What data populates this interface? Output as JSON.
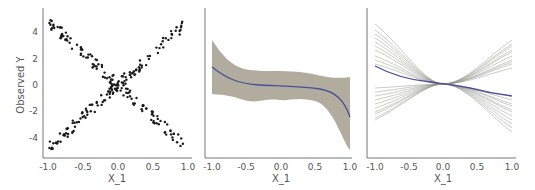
{
  "chart_data": [
    {
      "type": "scatter",
      "title": "",
      "xlabel": "X_1",
      "ylabel": "Observed Y",
      "xlim": [
        -1.0,
        1.0
      ],
      "ylim": [
        -5.2,
        5.2
      ],
      "xticks": [
        "-1.0",
        "-0.5",
        "0.0",
        "0.5",
        "1.0"
      ],
      "yticks": [
        "4",
        "2",
        "0",
        "-2",
        "-4"
      ],
      "grid": false,
      "series": [
        {
          "name": "y = 5x (increasing arm)",
          "x": [
            -1.0,
            -0.5,
            0.0,
            0.5,
            1.0
          ],
          "y": [
            -4.8,
            -2.5,
            0.0,
            2.5,
            4.8
          ]
        },
        {
          "name": "y = -5x (decreasing arm)",
          "x": [
            -1.0,
            -0.5,
            0.0,
            0.5,
            1.0
          ],
          "y": [
            4.9,
            2.5,
            0.0,
            -2.5,
            -4.8
          ]
        }
      ]
    },
    {
      "type": "line",
      "title": "",
      "xlabel": "X_1",
      "ylabel": "",
      "xlim": [
        -1.0,
        1.0
      ],
      "xticks": [
        "-1.0",
        "-0.5",
        "0.0",
        "0.5",
        "1.0"
      ],
      "grid": false,
      "series": [
        {
          "name": "mean",
          "x": [
            -1.0,
            -0.75,
            -0.5,
            -0.25,
            0.0,
            0.25,
            0.5,
            0.75,
            1.0
          ],
          "y": [
            1.4,
            0.6,
            0.2,
            0.05,
            0.0,
            0.0,
            -0.2,
            -0.8,
            -2.5
          ]
        },
        {
          "name": "upper band",
          "x": [
            -1.0,
            -0.75,
            -0.5,
            -0.25,
            0.0,
            0.25,
            0.5,
            0.75,
            1.0
          ],
          "y": [
            3.4,
            2.0,
            1.6,
            1.4,
            1.6,
            1.5,
            1.2,
            1.2,
            1.4
          ]
        },
        {
          "name": "lower band",
          "x": [
            -1.0,
            -0.75,
            -0.5,
            -0.25,
            0.0,
            0.25,
            0.5,
            0.75,
            1.0
          ],
          "y": [
            0.0,
            -0.4,
            -1.2,
            -1.6,
            -1.3,
            -1.5,
            -1.6,
            -2.4,
            -6.2
          ]
        }
      ]
    },
    {
      "type": "line",
      "title": "",
      "xlabel": "X_1",
      "ylabel": "",
      "xlim": [
        -1.0,
        1.0
      ],
      "xticks": [
        "-1.0",
        "-0.5",
        "0.0",
        "0.5",
        "1.0"
      ],
      "grid": false,
      "series": [
        {
          "name": "mean",
          "x": [
            -1.0,
            -0.5,
            0.0,
            0.5,
            1.0
          ],
          "y": [
            1.4,
            0.5,
            0.0,
            -0.4,
            -0.8
          ]
        },
        {
          "name": "samples (many, decreasing)",
          "x": [
            -1.0,
            0.0,
            1.0
          ],
          "y": [
            4.0,
            0.0,
            -3.5
          ]
        },
        {
          "name": "samples (many, increasing)",
          "x": [
            -1.0,
            0.0,
            1.0
          ],
          "y": [
            -2.5,
            0.0,
            2.8
          ]
        }
      ]
    }
  ],
  "panels": [
    {
      "xlabel": "X_1",
      "ylabel": "Observed Y",
      "xticks": [
        "-1.0",
        "-0.5",
        "0.0",
        "0.5",
        "1.0"
      ],
      "yticks": [
        "4",
        "2",
        "0",
        "-2",
        "-4"
      ]
    },
    {
      "xlabel": "X_1",
      "xticks": [
        "-1.0",
        "-0.5",
        "0.0",
        "0.5",
        "1.0"
      ]
    },
    {
      "xlabel": "X_1",
      "xticks": [
        "-1.0",
        "-0.5",
        "0.0",
        "0.5",
        "1.0"
      ]
    }
  ],
  "colors": {
    "points": "#1a1a1a",
    "band": "#a59d8e",
    "mean": "#4b4f9a",
    "samples": "#8a8f80",
    "axis": "#777777"
  }
}
